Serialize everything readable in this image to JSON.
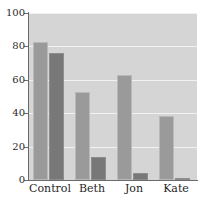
{
  "chart_data": {
    "type": "bar",
    "title": "",
    "xlabel": "",
    "ylabel": "",
    "categories": [
      "Control",
      "Beth",
      "Jon",
      "Kate"
    ],
    "series": [
      {
        "name": "series-1",
        "values": [
          82.5,
          53,
          63,
          38.5
        ],
        "color": "#9a9a9a"
      },
      {
        "name": "series-2",
        "values": [
          76,
          13.5,
          4.5,
          1.5
        ],
        "color": "#787878"
      }
    ],
    "ylim": [
      0,
      100
    ],
    "yticks": [
      0,
      20,
      40,
      60,
      80,
      100
    ],
    "ytick_labels": [
      "0",
      "20",
      "40",
      "60",
      "80",
      "100"
    ],
    "grid": true,
    "grid_color": "#f2f2f2",
    "plot_background": "#d5d5d5",
    "axis_color": "#6b6b6b",
    "legend": "none",
    "legend_position": "none"
  },
  "figure": {
    "top_clipped_text": ""
  }
}
